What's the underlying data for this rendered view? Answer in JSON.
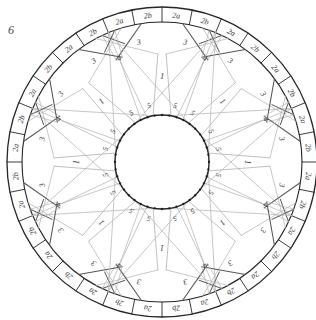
{
  "figure": {
    "number": "6",
    "caption_position": "top-left"
  },
  "diagram": {
    "type": "geometric-rosette",
    "center": {
      "x": 162,
      "y": 162
    },
    "outer_radius": 155,
    "rim_inner_radius": 140,
    "mid_radius": 108,
    "inner_beaded_radius": 47,
    "star_points": 8,
    "bead_count": 40,
    "colors": {
      "outer_stroke": "#262626",
      "chord_stroke": "#555555",
      "ray_stroke": "#b9b9b9",
      "bead_fill": "#1d1d1d",
      "label_fill": "#3a3a3a",
      "background": "#ffffff"
    },
    "label_groups": [
      {
        "id": "star-point",
        "text": "1",
        "count": 8,
        "radius": 86,
        "angles": [
          0,
          45,
          90,
          135,
          180,
          225,
          270,
          315
        ]
      },
      {
        "id": "inner-wedge",
        "text": "5",
        "count": 16,
        "radius": 58,
        "angles": [
          13,
          32,
          58,
          77,
          103,
          122,
          148,
          167,
          193,
          212,
          238,
          257,
          283,
          302,
          328,
          347
        ]
      },
      {
        "id": "mid-wedge",
        "text": "4",
        "count": 8,
        "radius": 112,
        "angles": [
          22.5,
          67.5,
          112.5,
          157.5,
          202.5,
          247.5,
          292.5,
          337.5
        ]
      },
      {
        "id": "outer-triangle",
        "text": "3",
        "count": 16,
        "radius": 122,
        "angles": [
          11,
          34,
          56,
          79,
          101,
          124,
          146,
          169,
          191,
          214,
          236,
          259,
          281,
          304,
          326,
          349
        ]
      },
      {
        "id": "rim-a",
        "text": "2a",
        "count": 16,
        "radius": 147,
        "angles": [
          5.6,
          28.1,
          50.6,
          73.1,
          95.6,
          118.1,
          140.6,
          163.1,
          185.6,
          208.1,
          230.6,
          253.1,
          275.6,
          298.1,
          320.6,
          343.1
        ]
      },
      {
        "id": "rim-b",
        "text": "2b",
        "count": 16,
        "radius": 147,
        "angles": [
          16.9,
          39.4,
          61.9,
          84.4,
          106.9,
          129.4,
          151.9,
          174.4,
          196.9,
          219.4,
          241.9,
          264.4,
          286.9,
          309.4,
          331.9,
          354.4
        ]
      }
    ],
    "legend_values": [
      "1",
      "2a",
      "2b",
      "3",
      "4",
      "5"
    ]
  },
  "chart_data": {
    "type": "diagram",
    "categories": [
      "1",
      "2a",
      "2b",
      "3",
      "4",
      "5"
    ],
    "values": [
      8,
      16,
      16,
      16,
      8,
      16
    ],
    "xlabel": "zone label",
    "ylabel": "occurrences",
    "annotations": [
      "6"
    ]
  }
}
